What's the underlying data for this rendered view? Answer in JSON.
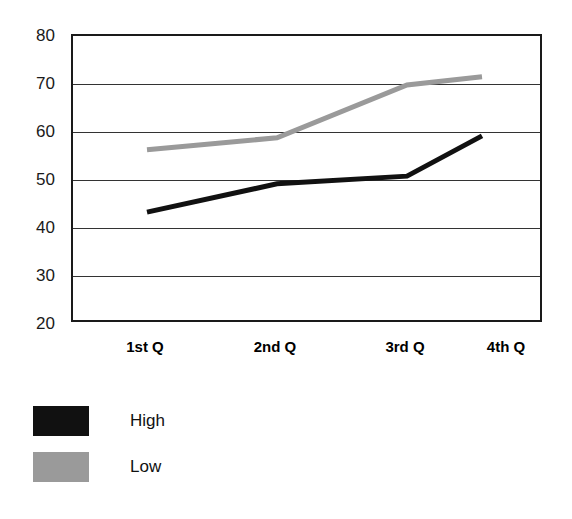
{
  "chart_data": {
    "type": "line",
    "title": "",
    "subtitle": "",
    "xlabel": "",
    "ylabel": "",
    "categories": [
      "1st Q",
      "2nd Q",
      "3rd Q",
      "4th Q"
    ],
    "series": [
      {
        "name": "High",
        "color": "#111111",
        "values": [
          43.3,
          49.2,
          50.8,
          59.2
        ]
      },
      {
        "name": "Low",
        "color": "#9a9a9a",
        "values": [
          56.3,
          58.8,
          69.8,
          71.5
        ]
      }
    ],
    "ylim": [
      20,
      80
    ],
    "yticks": [
      20,
      30,
      40,
      50,
      60,
      70,
      80
    ],
    "ytick_labels": [
      "20",
      "30",
      "40",
      "50",
      "60",
      "70",
      "80"
    ],
    "grid": true,
    "grid_axis": "y",
    "legend": true,
    "legend_position": "below-left",
    "markers": false,
    "line_width": 5,
    "background_color": "#ffffff",
    "axis_color": "#1a1a1a"
  },
  "legend": {
    "entries": [
      {
        "label": "High",
        "swatch_color": "#111111"
      },
      {
        "label": "Low",
        "swatch_color": "#9a9a9a"
      }
    ]
  }
}
